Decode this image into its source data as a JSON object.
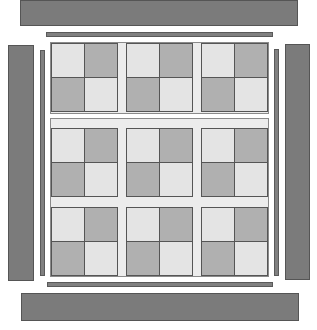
{
  "diagram": {
    "colors": {
      "outer_bar": "#7b7b7b",
      "bar_border": "#555555",
      "sashing": "#ececec",
      "light_square": "#e4e4e4",
      "dark_square": "#b0b0b0"
    },
    "grid": {
      "rows": 3,
      "cols": 3,
      "block_pattern": [
        [
          "light",
          "dark"
        ],
        [
          "dark",
          "light"
        ]
      ]
    },
    "borders": {
      "top_outer": "top-border-bar",
      "top_inner": "top-inner-strip",
      "bottom_outer": "bottom-border-bar",
      "bottom_inner": "bottom-inner-strip",
      "left_outer": "left-border-bar",
      "left_inner": "left-inner-strip",
      "right_outer": "right-border-bar",
      "right_inner": "right-inner-strip"
    }
  }
}
